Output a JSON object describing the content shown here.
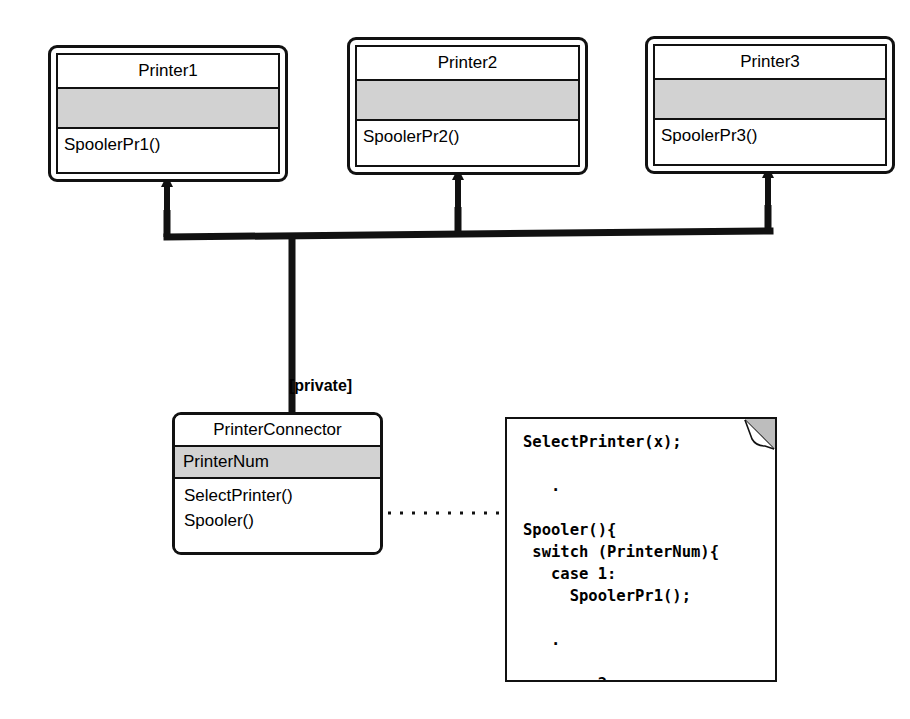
{
  "diagram": {
    "background_color": "#ffffff",
    "line_color": "#111111",
    "compartment_fill": "#d2d2d2",
    "note_fold_color": "#bdbdbd"
  },
  "classes": [
    {
      "id": "printer1",
      "name": "Printer1",
      "attributes": "",
      "operations": "SpoolerPr1()"
    },
    {
      "id": "printer2",
      "name": "Printer2",
      "attributes": "",
      "operations": "SpoolerPr2()"
    },
    {
      "id": "printer3",
      "name": "Printer3",
      "attributes": "",
      "operations": "SpoolerPr3()"
    }
  ],
  "connector": {
    "id": "printer-connector",
    "name": "PrinterConnector",
    "attributes": "PrinterNum",
    "operations": "SelectPrinter()\nSpooler()"
  },
  "edges": {
    "inheritance_label": "[private]",
    "arrow_style": "solid-filled-triangle",
    "note_link_style": "dotted",
    "socket_icon": "lollipop-socket-icon"
  },
  "note": {
    "id": "spooler-code-note",
    "code": "SelectPrinter(x);\n\n   .\n\nSpooler(){\n switch (PrinterNum){\n   case 1:\n     SpoolerPr1();\n\n   .\n\n   case 2:\n     SpoolerPr2();\n\n   .\n\n   ."
  }
}
